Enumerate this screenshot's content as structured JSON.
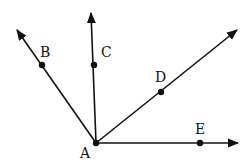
{
  "diagram": {
    "type": "rays-from-common-vertex",
    "vertex": {
      "label": "A",
      "x": 96,
      "y": 143,
      "label_x": 80,
      "label_y": 158
    },
    "rays": [
      {
        "name": "AB",
        "point_label": "B",
        "point": {
          "x": 42,
          "y": 65
        },
        "tip": {
          "x": 17,
          "y": 30
        },
        "label_x": 40,
        "label_y": 57
      },
      {
        "name": "AC",
        "point_label": "C",
        "point": {
          "x": 94,
          "y": 65
        },
        "tip": {
          "x": 91,
          "y": 13
        },
        "label_x": 101,
        "label_y": 57
      },
      {
        "name": "AD",
        "point_label": "D",
        "point": {
          "x": 161,
          "y": 92
        },
        "tip": {
          "x": 237,
          "y": 30
        },
        "label_x": 155,
        "label_y": 82
      },
      {
        "name": "AE",
        "point_label": "E",
        "point": {
          "x": 200,
          "y": 143
        },
        "tip": {
          "x": 238,
          "y": 143
        },
        "label_x": 195,
        "label_y": 134
      }
    ],
    "colors": {
      "stroke": "#111111",
      "background": "#ffffff"
    }
  }
}
